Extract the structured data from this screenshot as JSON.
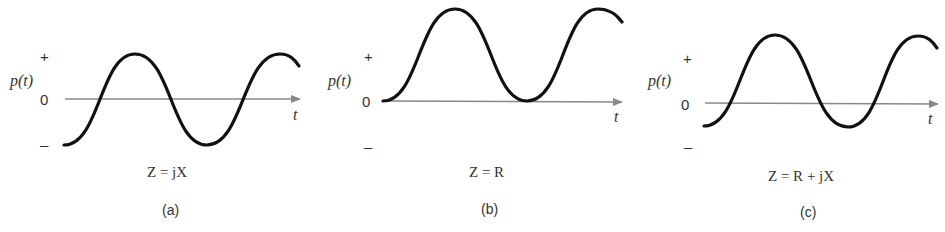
{
  "figure": {
    "panels": [
      {
        "id": "a",
        "y_label": "p(t)",
        "x_label": "t",
        "ticks": {
          "plus": "+",
          "zero": "0",
          "minus": "–"
        },
        "equation": "Z = jX",
        "caption": "(a)",
        "description": "Instantaneous power oscillates symmetrically about zero (purely reactive load, average power = 0)"
      },
      {
        "id": "b",
        "y_label": "p(t)",
        "x_label": "t",
        "ticks": {
          "plus": "+",
          "zero": "0",
          "minus": "–"
        },
        "equation": "Z = R",
        "caption": "(b)",
        "description": "Instantaneous power always non-negative (purely resistive load)"
      },
      {
        "id": "c",
        "y_label": "p(t)",
        "x_label": "t",
        "ticks": {
          "plus": "+",
          "zero": "0",
          "minus": "–"
        },
        "equation": "Z = R + jX",
        "caption": "(c)",
        "description": "Instantaneous power offset above zero with negative excursions (general load)"
      }
    ],
    "colors": {
      "curve": "#111111",
      "axis": "#888888",
      "text": "#333333"
    }
  }
}
